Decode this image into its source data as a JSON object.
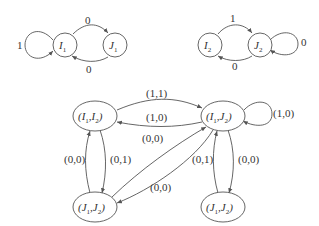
{
  "diagram": {
    "automaton1": {
      "nodes": [
        {
          "id": "I1",
          "letter": "I",
          "sub": "1"
        },
        {
          "id": "J1",
          "letter": "J",
          "sub": "1"
        }
      ],
      "edges": [
        {
          "from": "I1",
          "to": "I1",
          "label": "1"
        },
        {
          "from": "I1",
          "to": "J1",
          "label": "0"
        },
        {
          "from": "J1",
          "to": "I1",
          "label": "0"
        }
      ]
    },
    "automaton2": {
      "nodes": [
        {
          "id": "I2",
          "letter": "I",
          "sub": "2"
        },
        {
          "id": "J2",
          "letter": "J",
          "sub": "2"
        }
      ],
      "edges": [
        {
          "from": "I2",
          "to": "J2",
          "label": "1"
        },
        {
          "from": "J2",
          "to": "I2",
          "label": "0"
        },
        {
          "from": "J2",
          "to": "J2",
          "label": "0"
        }
      ]
    },
    "product": {
      "nodes": [
        {
          "id": "I1I2",
          "a": "I",
          "a_sub": "1",
          "b": "I",
          "b_sub": "2"
        },
        {
          "id": "I1J2",
          "a": "I",
          "a_sub": "1",
          "b": "J",
          "b_sub": "2"
        },
        {
          "id": "J1J2_left",
          "a": "J",
          "a_sub": "1",
          "b": "J",
          "b_sub": "2"
        },
        {
          "id": "J1J2_right",
          "a": "J",
          "a_sub": "1",
          "b": "J",
          "b_sub": "2"
        }
      ],
      "edges": [
        {
          "from": "I1I2",
          "to": "I1J2",
          "label": "(1,1)"
        },
        {
          "from": "I1J2",
          "to": "I1I2",
          "label": "(1,0)"
        },
        {
          "from": "I1J2",
          "to": "I1J2",
          "label": "(1,0)"
        },
        {
          "from": "J1J2_left",
          "to": "I1J2",
          "label": "(0,0)"
        },
        {
          "from": "I1J2",
          "to": "J1J2_left",
          "label": "(0,0)"
        },
        {
          "from": "J1J2_left",
          "to": "I1I2",
          "label": "(0,0)"
        },
        {
          "from": "I1I2",
          "to": "J1J2_left",
          "label": "(0,1)"
        },
        {
          "from": "J1J2_right",
          "to": "I1J2",
          "label": "(0,1)"
        },
        {
          "from": "I1J2",
          "to": "J1J2_right",
          "label": "(0,0)"
        }
      ]
    }
  }
}
